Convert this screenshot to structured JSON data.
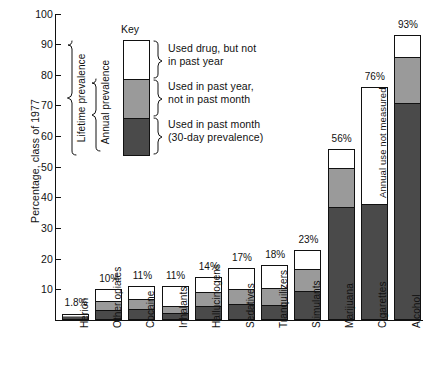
{
  "chart_data": {
    "type": "bar",
    "subtype": "stacked-bar",
    "title": "",
    "xlabel": "",
    "ylabel": "Percentage, class of 1977",
    "ylim": [
      0,
      100
    ],
    "yticks": [
      0,
      10,
      20,
      30,
      40,
      50,
      60,
      70,
      80,
      90,
      100
    ],
    "ytick_labels": [
      "",
      "10",
      "20",
      "30",
      "40",
      "50",
      "60",
      "70",
      "80",
      "90",
      "100"
    ],
    "grid": false,
    "legend_position": "inside-top-left",
    "categories": [
      "Herion",
      "Other opiates",
      "Cocaine",
      "Inhalants",
      "Hallucinogens",
      "Sedatives",
      "Tranquilizers",
      "Stimulants",
      "Marijuana",
      "Cigarettes",
      "Alcohol"
    ],
    "series": [
      {
        "name": "Used in past month (30-day prevalence)",
        "color": "#4a4a4a",
        "values": [
          1.0,
          3.0,
          3.5,
          2.0,
          4.5,
          5.0,
          5.0,
          9.5,
          37.0,
          38.0,
          71.0
        ]
      },
      {
        "name": "Used in past year, not in past month",
        "color": "#9a9a9a",
        "values": [
          0.6,
          3.0,
          3.5,
          2.5,
          4.5,
          5.0,
          5.5,
          7.5,
          13.0,
          0.0,
          15.0
        ]
      },
      {
        "name": "Used drug, but not in past year",
        "color": "#ffffff",
        "values": [
          0.2,
          4.0,
          4.0,
          6.5,
          5.0,
          7.0,
          7.5,
          6.0,
          6.0,
          38.0,
          7.0
        ]
      }
    ],
    "totals": [
      1.8,
      10,
      11,
      11,
      14,
      17,
      18,
      23,
      56,
      76,
      93
    ],
    "data_labels": [
      "1.8%",
      "10%",
      "11%",
      "11%",
      "14%",
      "17%",
      "18%",
      "23%",
      "56%",
      "76%",
      "93%"
    ],
    "annotations": [
      {
        "text": "Annual use not measured",
        "target": "Cigarettes",
        "orientation": "vertical"
      },
      {
        "text": "Lifetime prevalence",
        "type": "brace",
        "orientation": "vertical"
      },
      {
        "text": "Annual prevalence",
        "type": "brace",
        "orientation": "vertical"
      }
    ]
  },
  "axis": {
    "y_title": "Percentage, class of 1977",
    "y_ticks": [
      "100",
      "90",
      "80",
      "70",
      "60",
      "50",
      "40",
      "30",
      "20",
      "10"
    ]
  },
  "key": {
    "title": "Key",
    "label_lifetime_line1": "Used drug, but not",
    "label_lifetime_line2": "in past year",
    "label_annual_line1": "Used in past year,",
    "label_annual_line2": "not in past month",
    "label_month_line1": "Used in past month",
    "label_month_line2": "(30-day prevalence)",
    "brace_lifetime": "Lifetime prevalence",
    "brace_annual": "Annual prevalence"
  },
  "bars": {
    "categories": [
      "Herion",
      "Other opiates",
      "Cocaine",
      "Inhalants",
      "Hallucinogens",
      "Sedatives",
      "Tranquilizers",
      "Stimulants",
      "Marijuana",
      "Cigarettes",
      "Alcohol"
    ],
    "values": [
      "1.8%",
      "10%",
      "11%",
      "11%",
      "14%",
      "17%",
      "18%",
      "23%",
      "56%",
      "76%",
      "93%"
    ]
  },
  "notes": {
    "cigarettes": "Annual use not measured"
  },
  "colors": {
    "past_month": "#4a4a4a",
    "past_year": "#9a9a9a",
    "lifetime": "#ffffff",
    "axis": "#111111"
  }
}
